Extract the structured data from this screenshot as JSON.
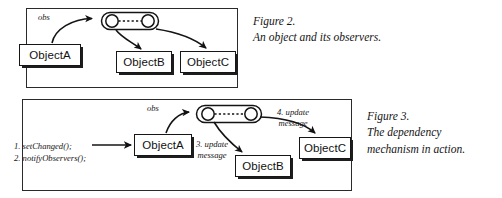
{
  "document": {
    "type": "textbook-figure-pair",
    "background_color": "#ffffff",
    "ink_color": "#1a1a1a"
  },
  "figure2": {
    "caption_lines": [
      "Figure 2.",
      "An object and its observers."
    ],
    "panel_label": "obs",
    "boxes": [
      {
        "id": "f2-objA",
        "label": "ObjectA"
      },
      {
        "id": "f2-objB",
        "label": "ObjectB"
      },
      {
        "id": "f2-objC",
        "label": "ObjectC"
      }
    ],
    "observer_capsule": {
      "name": "observer-registry-capsule",
      "node_count": 2,
      "connector": "dotted"
    },
    "arrows": [
      {
        "from": "ObjectA",
        "to": "observer-capsule"
      },
      {
        "from": "observer-capsule",
        "to": "ObjectB"
      },
      {
        "from": "observer-capsule",
        "to": "ObjectC"
      }
    ]
  },
  "figure3": {
    "caption_lines": [
      "Figure 3.",
      "The dependency",
      "mechanism in action."
    ],
    "panel_label": "obs",
    "call_labels": [
      "1. setChanged();",
      "2. notifyObservers();"
    ],
    "message_label_3": [
      "3. update",
      "message"
    ],
    "message_label_4": [
      "4. update",
      "message"
    ],
    "boxes": [
      {
        "id": "f3-objA",
        "label": "ObjectA"
      },
      {
        "id": "f3-objB",
        "label": "ObjectB"
      },
      {
        "id": "f3-objC",
        "label": "ObjectC"
      }
    ],
    "observer_capsule": {
      "name": "observer-registry-capsule",
      "node_count": 2,
      "connector": "dotted"
    },
    "arrows": [
      {
        "from": "call-labels",
        "to": "ObjectA"
      },
      {
        "from": "ObjectA",
        "to": "observer-capsule"
      },
      {
        "from": "observer-capsule",
        "to": "ObjectB"
      },
      {
        "from": "observer-capsule",
        "to": "ObjectC"
      }
    ]
  }
}
